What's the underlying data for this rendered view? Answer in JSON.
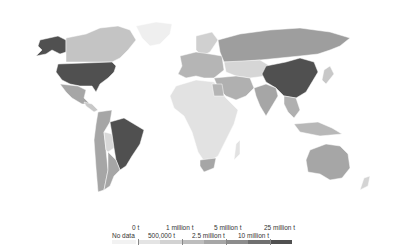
{
  "map": {
    "type": "choropleth",
    "projection": "world",
    "color_scheme": "grayscale",
    "legend": {
      "no_data_label": "No data",
      "top_labels": [
        "0 t",
        "1 million t",
        "5 million t",
        "25 million t"
      ],
      "bottom_labels": [
        "500,000 t",
        "2.5 million t",
        "10 million t"
      ],
      "bins": [
        {
          "label": "No data",
          "color": "#f2f2f2"
        },
        {
          "label": "0 t – 500,000 t",
          "color": "#e4e4e4"
        },
        {
          "label": "500,000 t – 1 million t",
          "color": "#d2d2d2"
        },
        {
          "label": "1 million t – 2.5 million t",
          "color": "#bdbdbd"
        },
        {
          "label": "2.5 million t – 5 million t",
          "color": "#a6a6a6"
        },
        {
          "label": "5 million t – 10 million t",
          "color": "#8c8c8c"
        },
        {
          "label": "10 million t – 25 million t",
          "color": "#6f6f6f"
        },
        {
          "label": "25 million t+",
          "color": "#505050"
        }
      ]
    },
    "regions": {
      "usa": "#505050",
      "alaska": "#505050",
      "canada": "#c4c4c4",
      "greenland": "#efefef",
      "mexico": "#a6a6a6",
      "central_america": "#c8c8c8",
      "brazil": "#505050",
      "south_america_rest": "#a6a6a6",
      "south_america_light": "#d8d8d8",
      "europe": "#b5b5b5",
      "scandinavia": "#d0d0d0",
      "russia": "#9e9e9e",
      "central_asia": "#d6d6d6",
      "middle_east": "#b0b0b0",
      "china": "#505050",
      "india": "#a6a6a6",
      "southeast_asia": "#b0b0b0",
      "africa": "#e2e2e2",
      "south_africa": "#a6a6a6",
      "egypt": "#b5b5b5",
      "australia": "#a6a6a6",
      "new_zealand": "#d4d4d4",
      "indonesia": "#b8b8b8",
      "japan": "#c8c8c8"
    }
  }
}
